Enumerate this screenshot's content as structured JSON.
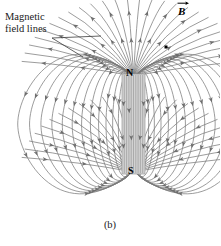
{
  "figure": {
    "caption": "(b)",
    "annotations": {
      "field_lines_label_line1": "Magnetic",
      "field_lines_label_line2": "field lines",
      "b_vector_label": "B",
      "b_vector_icon": "vector-arrow-icon"
    },
    "magnet": {
      "north_pole_label": "N",
      "south_pole_label": "S",
      "x": 122,
      "y": 74,
      "width": 23,
      "height": 100,
      "fill_color": "#d2d2d2",
      "edge_color": "#9a9a9a"
    },
    "style": {
      "field_line_color": "#7b7b7b",
      "field_line_width": 0.75,
      "arrow_color": "#6e6e6e",
      "leader_color": "#3a3a3a",
      "background": "#ffffff",
      "point_marker_color": "#000000"
    },
    "point_marker": {
      "x": 166,
      "y": 47,
      "size": 3
    },
    "leader_lines": [
      {
        "x1": 52,
        "y1": 38,
        "x2": 101,
        "y2": 36
      },
      {
        "x1": 52,
        "y1": 38,
        "x2": 83,
        "y2": 57
      }
    ],
    "dipole": {
      "center_x": 133.5,
      "north_y": 76,
      "south_y": 172,
      "outer_loop_count": 13,
      "internal_line_count": 9,
      "radial_spoke_count": 26
    }
  },
  "chart_data": {
    "type": "diagram",
    "labels": [
      "Magnetic field lines",
      "B",
      "N",
      "S",
      "(b)"
    ]
  }
}
